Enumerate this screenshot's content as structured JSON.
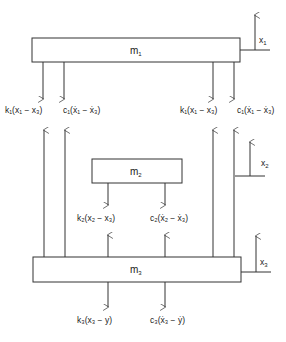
{
  "diagram": {
    "title": "",
    "masses": [
      {
        "id": "m1",
        "label": "m",
        "sub": "1"
      },
      {
        "id": "m2",
        "label": "m",
        "sub": "2"
      },
      {
        "id": "m3",
        "label": "m",
        "sub": "3"
      }
    ],
    "displacements": [
      {
        "id": "x1",
        "label": "x",
        "sub": "1"
      },
      {
        "id": "x2",
        "label": "x",
        "sub": "2"
      },
      {
        "id": "x3",
        "label": "x",
        "sub": "3"
      }
    ],
    "forces": {
      "m1_left_spring": "k₁(x₁ − x₃)",
      "m1_left_damper": "c₁(ẋ₁ − ẋ₃)",
      "m1_right_spring": "k₁(x₁ − x₃)",
      "m1_right_damper": "c₁(ẋ₁ − ẋ₃)",
      "m2_spring": "k₂(x₂ − x₃)",
      "m2_damper": "c₂(ẋ₂ − ẋ₃)",
      "m3_spring": "k₃(x₃ − y)",
      "m3_damper": "c₃(ẋ₃ − ẏ)"
    },
    "line_color": "#333333"
  }
}
